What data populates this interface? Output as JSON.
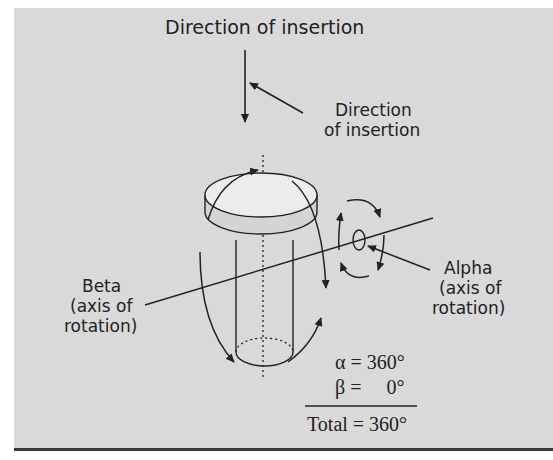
{
  "labels": {
    "top_title": "Direction of insertion",
    "insertion_line1": "Direction",
    "insertion_line2": "of insertion",
    "beta_line1": "Beta",
    "beta_line2": "(axis of",
    "beta_line3": "rotation)",
    "alpha_line1": "Alpha",
    "alpha_line2": "(axis of",
    "alpha_line3": "rotation)"
  },
  "equations": {
    "alpha": "α = 360°",
    "beta": "β =     0°",
    "total": "Total = 360°"
  },
  "colors": {
    "background": "#d9d9d9",
    "ink": "#222222",
    "cap_fill": "#ececec"
  }
}
